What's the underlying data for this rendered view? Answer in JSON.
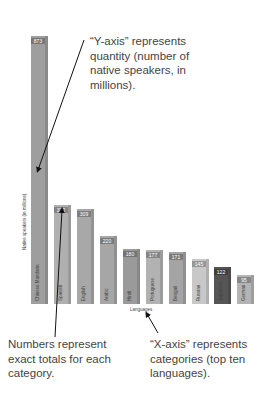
{
  "chart_data": {
    "type": "bar",
    "title": "",
    "xlabel": "Languages",
    "ylabel": "Native speakers (in millions)",
    "categories": [
      "Chinese Mandarin",
      "Spanish",
      "English",
      "Arabic",
      "Hindi",
      "Portuguese",
      "Bengali",
      "Russian",
      "Japanese",
      "German"
    ],
    "values": [
      873,
      322,
      309,
      220,
      180,
      177,
      171,
      145,
      122,
      95
    ],
    "value_labels": [
      "873",
      "322",
      "309",
      "220",
      "180",
      "177",
      "171",
      "145",
      "122",
      "95"
    ],
    "bar_colors": [
      "#9e9e9e",
      "#b0b0b0",
      "#a8a8a8",
      "#a6a6a6",
      "#9a9a9a",
      "#b2b2b2",
      "#a4a4a4",
      "#c8c8c8",
      "#555555",
      "#b4b4b4"
    ],
    "ylim": [
      0,
      900
    ],
    "grid": false,
    "legend": "none",
    "annotations": [
      "“Y-axis” represents quantity (number of native speakers, in millions).",
      "Numbers represent exact totals for each category.",
      "“X-axis” represents categories (top ten languages)."
    ]
  },
  "annotations": {
    "y_axis_lines": [
      "“Y-axis” represents",
      "quantity (number of",
      "native speakers, in",
      "millions)."
    ],
    "numbers_lines": [
      "Numbers represent",
      "exact totals for each",
      "category."
    ],
    "x_axis_lines": [
      "“X-axis” represents",
      "categories (top ten",
      "languages)."
    ]
  }
}
